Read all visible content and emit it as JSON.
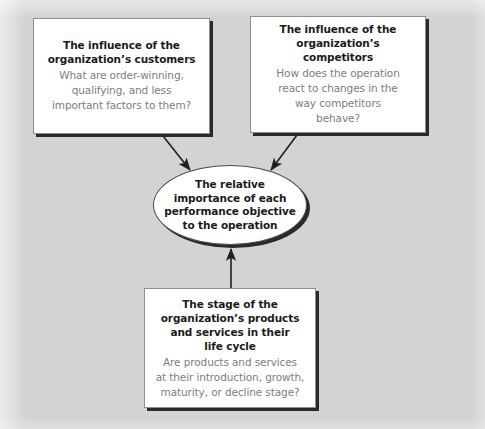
{
  "diagram": {
    "background_color": "#d3d3d3",
    "node_fill": "#ffffff",
    "node_border_color": "#8e8e8e",
    "shadow_color": "#2a2a2a",
    "heading_color": "#1a1a1a",
    "body_text_color": "#7d7d7d",
    "arrow_color": "#1f1f1f"
  },
  "nodes": {
    "customers": {
      "title": "The influence of the\norganization’s customers",
      "body": "What are order-winning,\nqualifying, and less\nimportant factors to them?"
    },
    "competitors": {
      "title": "The influence of the\norganization’s competitors",
      "body": "How does the operation\nreact to changes in the\nway competitors\nbehave?"
    },
    "lifecycle": {
      "title": "The stage of the\norganization’s products\nand services in their\nlife cycle",
      "body": "Are products and services\nat their introduction, growth,\nmaturity, or decline stage?"
    },
    "core": {
      "text": "The relative\nimportance of each\nperformance objective\nto the operation"
    }
  },
  "edges": [
    {
      "from": "customers",
      "to": "core",
      "direction": "down-right",
      "arrowhead": "filled"
    },
    {
      "from": "competitors",
      "to": "core",
      "direction": "down-left",
      "arrowhead": "filled"
    },
    {
      "from": "lifecycle",
      "to": "core",
      "direction": "up",
      "arrowhead": "filled"
    }
  ]
}
